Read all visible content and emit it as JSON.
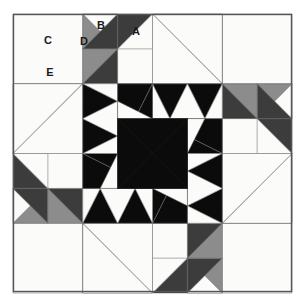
{
  "block": {
    "title": "Pieced Quilt Block Diagram",
    "grid_columns": 8,
    "grid_rows": 8,
    "frame": {
      "x": 13,
      "y": 14,
      "width": 279,
      "height": 278,
      "border_color": "#555555",
      "border_width": 1.4
    },
    "cell_size": 34.875
  },
  "palette": {
    "white": "#fbfbfa",
    "medium_gray": "#8c8c8c",
    "dark_gray": "#3c3c3c",
    "black": "#0b0b0b",
    "seam_line": "#6e6e6e",
    "background": "#ffffff",
    "label_color": "#1a1a1a"
  },
  "labels": [
    {
      "id": "A",
      "text": "A",
      "x": 136,
      "y": 32
    },
    {
      "id": "B",
      "text": "B",
      "x": 101,
      "y": 26
    },
    {
      "id": "C",
      "text": "C",
      "x": 48,
      "y": 41
    },
    {
      "id": "D",
      "text": "D",
      "x": 84,
      "y": 42
    },
    {
      "id": "E",
      "text": "E",
      "x": 50,
      "y": 73
    }
  ],
  "legend": {
    "A": "Large white corner triangle square",
    "B": "Dark gray point triangle",
    "C": "Plain white square",
    "D": "Medium gray triangle",
    "E": "Dark gray triangle"
  },
  "chart_data": {
    "type": "table",
    "note": "8x8 grid quilt block with four-fold rotational symmetry",
    "shapes": [
      {
        "name": "corner-square-c-tl",
        "fill": "white",
        "points": "13,14 83,14 83,84 13,84"
      },
      {
        "name": "d-tri-upper",
        "fill": "medium_gray",
        "points": "83,14 118,14 83,49"
      },
      {
        "name": "b-tri-left",
        "fill": "white",
        "points": "83,14 118,14 118,49"
      },
      {
        "name": "b-tri-right",
        "fill": "dark_gray",
        "points": "118,14 153,14 118,49"
      },
      {
        "name": "a-white-square",
        "fill": "white",
        "points": "153,14 188,14 188,49 153,49"
      },
      {
        "name": "d-tri-lower",
        "fill": "medium_gray",
        "points": "83,49 118,49 83,84"
      },
      {
        "name": "b-tri-lower",
        "fill": "dark_gray",
        "points": "118,14 118,49 83,49"
      },
      {
        "name": "center-square",
        "fill": "black",
        "points": "118,118 188,118 188,188 118,188"
      },
      {
        "name": "a-peak-white",
        "fill": "white",
        "points": "118,84 153,49 188,84"
      },
      {
        "name": "e-tri",
        "fill": "dark_gray",
        "points": "13,49 83,49 13,84"
      }
    ],
    "colors_used": [
      "#fbfbfa",
      "#8c8c8c",
      "#3c3c3c",
      "#0b0b0b"
    ],
    "symmetry": "4-fold rotational (90 degrees)"
  }
}
